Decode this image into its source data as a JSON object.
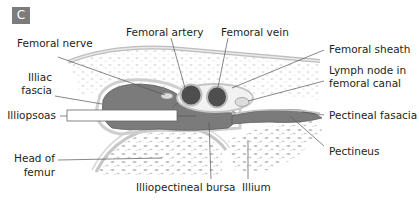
{
  "panel": {
    "letter": "C"
  },
  "labels": {
    "femoral_nerve": "Femoral nerve",
    "femoral_artery": "Femoral artery",
    "femoral_vein": "Femoral vein",
    "femoral_sheath": "Femoral sheath",
    "lymph_node_line1": "Lymph node in",
    "lymph_node_line2": "femoral canal",
    "illiac_fascia_line1": "Illiac",
    "illiac_fascia_line2": "fascia",
    "illiopsoas": "Illiopsoas",
    "pectineal_fascia": "Pectineal fasacia",
    "pectineus": "Pectineus",
    "head_of_femur_line1": "Head of",
    "head_of_femur_line2": "femur",
    "illiopectineal_bursa": "Illiopectineal bursa",
    "illium": "Illium"
  },
  "colors": {
    "muscle": "#7b7b7b",
    "vessel": "#4e4e4e",
    "fascia": "#c9c9c9",
    "leader": "#555555",
    "text": "#231f20",
    "badge": "#7c7c7c"
  }
}
